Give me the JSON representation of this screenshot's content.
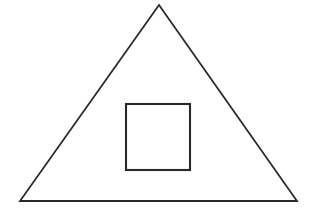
{
  "canvas": {
    "width": 321,
    "height": 212,
    "background_color": "#ffffff",
    "description": "Line drawing of a large triangle containing a smaller square"
  },
  "style": {
    "stroke_color": "#2a2a2a",
    "stroke_width": 1.8,
    "fill": "none"
  },
  "shapes": {
    "triangle": {
      "name": "outer-triangle",
      "type": "triangle",
      "points": "159,5 297,201 20,201",
      "vertices": [
        {
          "label": "apex",
          "x": 159,
          "y": 5
        },
        {
          "label": "bottom-right",
          "x": 297,
          "y": 201
        },
        {
          "label": "bottom-left",
          "x": 20,
          "y": 201
        }
      ],
      "stroke_color": "#2a2a2a",
      "stroke_width": 1.8,
      "fill": "none"
    },
    "square": {
      "name": "inner-square",
      "type": "rectangle",
      "x": 126,
      "y": 104,
      "width": 64,
      "height": 66,
      "stroke_color": "#2a2a2a",
      "stroke_width": 2.1,
      "fill": "none"
    }
  }
}
